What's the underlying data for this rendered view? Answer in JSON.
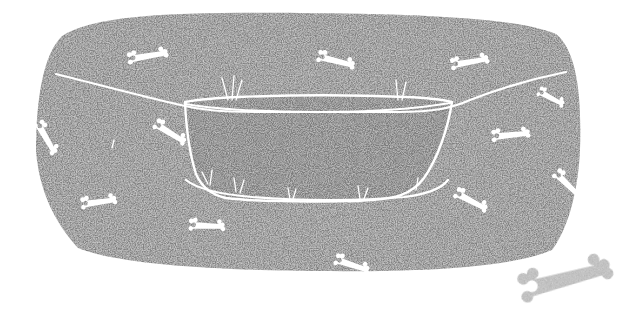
{
  "illustration": {
    "title": "Dog bed with bone pattern",
    "subject": "dog-bed",
    "style": "stippled grayscale drawing",
    "canvas": {
      "width": 635,
      "height": 317,
      "background": "#ffffff"
    },
    "colors": {
      "bed_fill": "#808080",
      "bed_speckle_light": "#c9c9c9",
      "bed_speckle_dark": "#6e6e6e",
      "basin_fill": "#7b7b7b",
      "outline": "#ffffff",
      "pattern_bone": "#ffffff",
      "loose_bone": "#b8b8b8",
      "background": "#ffffff"
    },
    "bed": {
      "name": "dog-bed-body",
      "outline_path": "M 36 152 C 36 96 44 54 62 36 C 96 14 180 12 300 13 C 420 14 520 18 556 34 C 576 50 582 92 580 150 C 578 196 566 232 552 250 C 510 268 420 272 316 271 C 210 270 118 264 78 248 C 58 226 40 196 36 152 Z",
      "rim_path": "M 56 74 C 96 84 142 96 176 104 C 200 110 220 112 260 112 L 398 112 C 434 112 452 108 470 100 C 506 86 546 76 566 72"
    },
    "basin": {
      "name": "bed-inner-basin",
      "outline_path": "M 185 102 C 196 100 214 98 240 97 C 290 95 360 95 406 97 C 430 98 444 100 452 102 C 448 128 438 158 424 178 C 412 194 398 200 352 201 C 300 202 250 201 226 198 C 212 195 202 188 196 174 C 189 152 186 124 185 102 Z",
      "front_lip_path": "M 186 180 C 196 188 216 194 252 197 C 300 201 360 201 404 197 C 428 194 442 188 448 180"
    },
    "basin_inner_edge": {
      "name": "basin-upper-rim-line",
      "path": "M 186 104 C 220 110 270 112 320 112 C 372 112 414 109 450 103"
    },
    "tick_marks": [
      {
        "name": "tick-mark",
        "x1": 228,
        "y1": 100,
        "x2": 222,
        "y2": 78
      },
      {
        "name": "tick-mark",
        "x1": 232,
        "y1": 100,
        "x2": 234,
        "y2": 76
      },
      {
        "name": "tick-mark",
        "x1": 236,
        "y1": 100,
        "x2": 242,
        "y2": 80
      },
      {
        "name": "tick-mark",
        "x1": 398,
        "y1": 100,
        "x2": 396,
        "y2": 80
      },
      {
        "name": "tick-mark",
        "x1": 402,
        "y1": 100,
        "x2": 406,
        "y2": 82
      },
      {
        "name": "tick-mark",
        "x1": 208,
        "y1": 184,
        "x2": 202,
        "y2": 172
      },
      {
        "name": "tick-mark",
        "x1": 210,
        "y1": 185,
        "x2": 212,
        "y2": 170
      },
      {
        "name": "tick-mark",
        "x1": 236,
        "y1": 192,
        "x2": 234,
        "y2": 178
      },
      {
        "name": "tick-mark",
        "x1": 240,
        "y1": 193,
        "x2": 244,
        "y2": 180
      },
      {
        "name": "tick-mark",
        "x1": 290,
        "y1": 199,
        "x2": 288,
        "y2": 188
      },
      {
        "name": "tick-mark",
        "x1": 293,
        "y1": 199,
        "x2": 296,
        "y2": 189
      },
      {
        "name": "tick-mark",
        "x1": 360,
        "y1": 199,
        "x2": 358,
        "y2": 186
      },
      {
        "name": "tick-mark",
        "x1": 364,
        "y1": 199,
        "x2": 368,
        "y2": 188
      },
      {
        "name": "tick-mark",
        "x1": 416,
        "y1": 190,
        "x2": 418,
        "y2": 178
      },
      {
        "name": "tick-mark",
        "x1": 112,
        "y1": 148,
        "x2": 114,
        "y2": 140
      }
    ],
    "pattern_bones": [
      {
        "name": "pattern-bone",
        "id": "bone-top-left",
        "cx": 148,
        "cy": 56,
        "len": 34,
        "thick": 7,
        "rot": -8
      },
      {
        "name": "pattern-bone",
        "id": "bone-top-mid",
        "cx": 336,
        "cy": 61,
        "len": 32,
        "thick": 7,
        "rot": 16
      },
      {
        "name": "pattern-bone",
        "id": "bone-top-right",
        "cx": 470,
        "cy": 62,
        "len": 32,
        "thick": 7,
        "rot": -8
      },
      {
        "name": "pattern-bone",
        "id": "bone-right-rim",
        "cx": 551,
        "cy": 98,
        "len": 24,
        "thick": 6,
        "rot": 30
      },
      {
        "name": "pattern-bone",
        "id": "bone-left-edge",
        "cx": 46,
        "cy": 138,
        "len": 30,
        "thick": 7,
        "rot": 62
      },
      {
        "name": "pattern-bone",
        "id": "bone-left-mid",
        "cx": 170,
        "cy": 133,
        "len": 30,
        "thick": 7,
        "rot": 34
      },
      {
        "name": "pattern-bone",
        "id": "bone-right-mid",
        "cx": 511,
        "cy": 135,
        "len": 32,
        "thick": 7,
        "rot": -4
      },
      {
        "name": "pattern-bone",
        "id": "bone-right-far",
        "cx": 568,
        "cy": 185,
        "len": 30,
        "thick": 7,
        "rot": 46
      },
      {
        "name": "pattern-bone",
        "id": "bone-lower-left",
        "cx": 99,
        "cy": 202,
        "len": 30,
        "thick": 7,
        "rot": -6
      },
      {
        "name": "pattern-bone",
        "id": "bone-right-lower",
        "cx": 471,
        "cy": 201,
        "len": 30,
        "thick": 7,
        "rot": 30
      },
      {
        "name": "pattern-bone",
        "id": "bone-bottom-left",
        "cx": 207,
        "cy": 226,
        "len": 30,
        "thick": 7,
        "rot": 4
      },
      {
        "name": "pattern-bone",
        "id": "bone-bottom-center",
        "cx": 352,
        "cy": 265,
        "len": 30,
        "thick": 7,
        "rot": 20
      }
    ],
    "loose_bone": {
      "name": "loose-bone",
      "cx": 566,
      "cy": 279,
      "len": 78,
      "thick": 17,
      "rot": -13,
      "color": "#b8b8b8"
    }
  }
}
